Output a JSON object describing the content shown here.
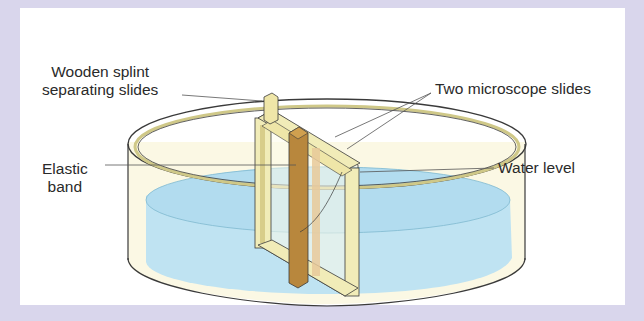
{
  "diagram": {
    "labels": {
      "wooden_splint": [
        "Wooden splint",
        "separating slides"
      ],
      "microscope_slides": "Two microscope slides",
      "elastic_band": [
        "Elastic",
        "band"
      ],
      "water_level": "Water level"
    },
    "colors": {
      "frame_background": "#d9d6ec",
      "panel": "#ffffff",
      "water": "#bfe3f2",
      "dish_fill": "#fbf8e4",
      "slide_edge": "#f1ecb8",
      "elastic_band": "#b8873d",
      "splint": "#efe6a8",
      "outline": "#3a3a3a",
      "leader_line": "#555555"
    }
  }
}
